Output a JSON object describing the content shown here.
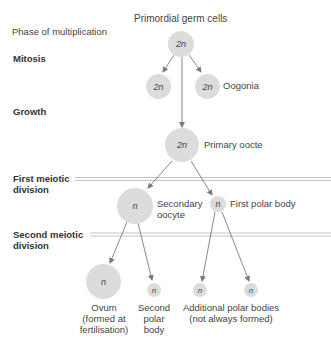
{
  "title": "Primordial germ cells",
  "phases": {
    "multiplication": "Phase of multiplication",
    "mitosis": "Mitosis",
    "growth": "Growth",
    "first_meiotic_1": "First meiotic",
    "first_meiotic_2": "division",
    "second_meiotic_1": "Second meiotic",
    "second_meiotic_2": "division"
  },
  "cells": {
    "primordial": "2n",
    "mitosis_left": "2n",
    "mitosis_right": "2n",
    "primary_oocyte": "2n",
    "secondary_oocyte": "n",
    "first_polar_body": "n",
    "ovum": "n",
    "second_polar_body": "n",
    "additional_1": "n",
    "additional_2": "n"
  },
  "labels": {
    "oogonia": "Oogonia",
    "primary_oocyte": "Primary oocte",
    "secondary_oocyte_1": "Secondary",
    "secondary_oocyte_2": "oocyte",
    "first_polar_body": "First polar body",
    "ovum_1": "Ovum",
    "ovum_2": "(formed at",
    "ovum_3": "fertilisation)",
    "second_polar_1": "Second",
    "second_polar_2": "polar",
    "second_polar_3": "body",
    "additional_1": "Additional polar bodies",
    "additional_2": "(not always formed)"
  },
  "colors": {
    "cell_fill": "#dcdcdc",
    "arrow": "#7a7a7a",
    "divider": "#b8b8b8"
  }
}
